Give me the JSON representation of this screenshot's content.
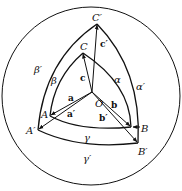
{
  "diagram": {
    "colors": {
      "stroke": "#111111",
      "background": "#ffffff"
    },
    "points": {
      "O": {
        "label": "O",
        "x": 92,
        "y": 92
      },
      "A": {
        "label": "A",
        "x": 50,
        "y": 116
      },
      "B": {
        "label": "B",
        "x": 131,
        "y": 127
      },
      "C": {
        "label": "C",
        "x": 83,
        "y": 53
      },
      "A_prime": {
        "label": "A′",
        "x": 38,
        "y": 130
      },
      "B_prime": {
        "label": "B′",
        "x": 138,
        "y": 143
      },
      "C_prime": {
        "label": "C′",
        "x": 97,
        "y": 24
      }
    },
    "vectors": {
      "a": "a",
      "b": "b",
      "c": "c",
      "a_prime": "a′",
      "b_prime": "b′",
      "c_prime": "c′"
    },
    "arcs": {
      "alpha": "α",
      "beta": "β",
      "gamma": "γ",
      "alpha_prime": "α′",
      "beta_prime": "β′",
      "gamma_prime": "γ′"
    }
  }
}
